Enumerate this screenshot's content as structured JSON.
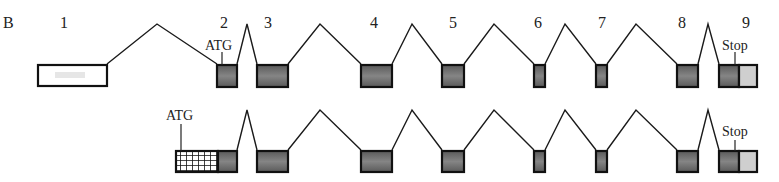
{
  "panel_label": "B",
  "colors": {
    "exon_fill": "#6e6e6e",
    "utr5_fill": "#ffffff",
    "utr3_fill": "#cfcfcf",
    "outline": "#111111"
  },
  "exon_numbers": [
    "1",
    "2",
    "3",
    "4",
    "5",
    "6",
    "7",
    "8",
    "9"
  ],
  "row1": {
    "start_codon": "ATG",
    "stop_codon": "Stop",
    "exons": [
      {
        "n": "1",
        "x": 38,
        "w": 69,
        "type": "utr5"
      },
      {
        "n": "2",
        "x": 217,
        "w": 20,
        "type": "coding"
      },
      {
        "n": "3",
        "x": 257,
        "w": 31,
        "type": "coding"
      },
      {
        "n": "4",
        "x": 361,
        "w": 31,
        "type": "coding"
      },
      {
        "n": "5",
        "x": 442,
        "w": 22,
        "type": "coding"
      },
      {
        "n": "6",
        "x": 534,
        "w": 11,
        "type": "coding"
      },
      {
        "n": "7",
        "x": 596,
        "w": 11,
        "type": "coding"
      },
      {
        "n": "8",
        "x": 677,
        "w": 21,
        "type": "coding"
      },
      {
        "n": "9",
        "x": 719,
        "w": 38,
        "type": "coding+utr3"
      }
    ]
  },
  "row2": {
    "start_codon": "ATG",
    "stop_codon": "Stop",
    "first_exon_note": "novel exon with grid-pattern 5' region fused to exon 2"
  }
}
